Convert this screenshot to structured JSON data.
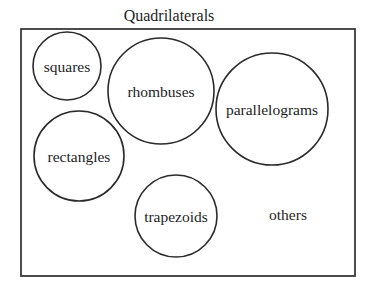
{
  "diagram": {
    "title": "Quadrilaterals",
    "type": "set-diagram",
    "universe": {
      "label": "Quadrilaterals",
      "x": 21,
      "y": 29,
      "width": 334,
      "height": 247
    },
    "sets": [
      {
        "id": "squares",
        "label": "squares",
        "cx": 67,
        "cy": 66,
        "r": 34
      },
      {
        "id": "rhombuses",
        "label": "rhombuses",
        "cx": 161,
        "cy": 91,
        "r": 53
      },
      {
        "id": "parallelograms",
        "label": "parallelograms",
        "cx": 272,
        "cy": 109,
        "r": 56
      },
      {
        "id": "rectangles",
        "label": "rectangles",
        "cx": 79,
        "cy": 156,
        "r": 45
      },
      {
        "id": "trapezoids",
        "label": "trapezoids",
        "cx": 176,
        "cy": 216,
        "r": 41
      }
    ],
    "free_labels": [
      {
        "id": "others",
        "label": "others",
        "x": 288,
        "y": 214
      }
    ],
    "colors": {
      "stroke": "#2a2a2a",
      "text": "#1e1e1e",
      "background": "#ffffff"
    }
  }
}
